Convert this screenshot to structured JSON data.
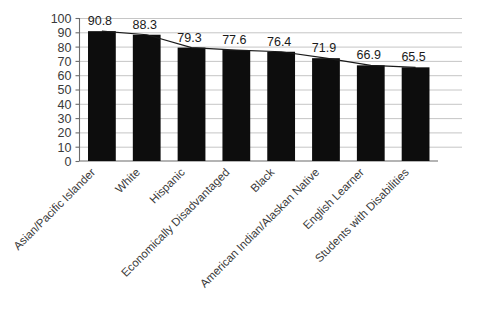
{
  "chart_data": {
    "type": "bar",
    "title": "",
    "subtitle": "",
    "xlabel": "",
    "ylabel": "",
    "ylim": [
      0,
      100
    ],
    "ytick_step": 10,
    "yticks": [
      "0",
      "10",
      "20",
      "30",
      "40",
      "50",
      "60",
      "70",
      "80",
      "90",
      "100"
    ],
    "grid": true,
    "legend": "none",
    "categories": [
      "Asian/Pacific Islander",
      "White",
      "Hispanic",
      "Economically Disadvantaged",
      "Black",
      "American Indian/Alaskan Native",
      "English Learner",
      "Students with Disabilities"
    ],
    "values": [
      90.8,
      88.3,
      79.3,
      77.6,
      76.4,
      71.9,
      66.9,
      65.5
    ],
    "value_labels": [
      "90.8",
      "88.3",
      "79.3",
      "77.6",
      "76.4",
      "71.9",
      "66.9",
      "65.5"
    ],
    "overlay_line": {
      "name": "trend",
      "values": [
        90.8,
        88.3,
        79.3,
        77.6,
        76.4,
        71.9,
        66.9,
        65.5
      ]
    },
    "colors": {
      "bar": "#0d0d0d",
      "gridline": "#bfbfbf",
      "axis": "#6b6b6b",
      "line": "#1a1a1a",
      "background": "#ffffff",
      "text": "#3a3a3a"
    }
  }
}
